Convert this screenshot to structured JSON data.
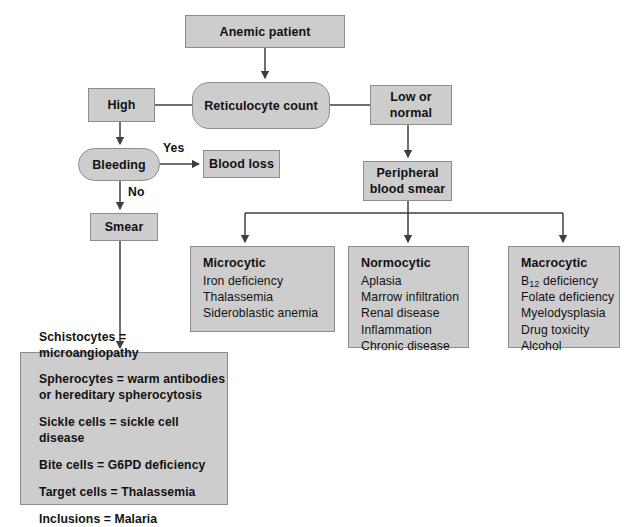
{
  "colors": {
    "node_fill": "#cdcdcd",
    "node_border": "#8d8d8d",
    "text": "#121212",
    "wire": "#3f3f3f",
    "background": "#ffffff"
  },
  "nodes": {
    "anemic_patient": "Anemic patient",
    "reticulocyte_count": "Reticulocyte  count",
    "high": "High",
    "low_or_normal_line1": "Low or",
    "low_or_normal_line2": "normal",
    "bleeding": "Bleeding",
    "blood_loss": "Blood loss",
    "peripheral_line1": "Peripheral",
    "peripheral_line2": "blood smear",
    "smear": "Smear"
  },
  "edge_labels": {
    "yes": "Yes",
    "no": "No"
  },
  "categories": [
    {
      "header": "Microcytic",
      "items": [
        "Iron deficiency",
        "Thalassemia",
        "Sideroblastic anemia"
      ]
    },
    {
      "header": "Normocytic",
      "items": [
        "Aplasia",
        "Marrow infiltration",
        "Renal disease",
        "Inflammation",
        "Chronic disease"
      ]
    },
    {
      "header": "Macrocytic",
      "items": [
        "B12 deficiency",
        "Folate deficiency",
        "Myelodysplasia",
        "Drug toxicity",
        "Alcohol"
      ],
      "items_display": [
        "B",
        "12",
        " deficiency"
      ]
    }
  ],
  "smear_findings": [
    {
      "text": "Schistocytes = microangiopathy",
      "cont": ""
    },
    {
      "text": "Spherocytes = warm antibodies",
      "cont": "or hereditary spherocytosis"
    },
    {
      "text": "Sickle cells = sickle cell disease",
      "cont": ""
    },
    {
      "text": "Bite cells = G6PD deficiency",
      "cont": ""
    },
    {
      "text": "Target cells = Thalassemia",
      "cont": ""
    },
    {
      "text": "Inclusions = Malaria",
      "cont": ""
    }
  ]
}
